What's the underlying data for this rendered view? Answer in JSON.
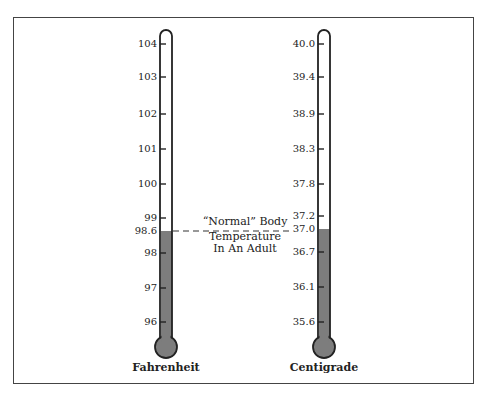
{
  "diagram": {
    "annotation": {
      "lines": [
        "“Normal” Body",
        "Temperature",
        "In An Adult"
      ]
    },
    "fahrenheit": {
      "title": "Fahrenheit",
      "ticks": [
        {
          "label": "104",
          "y": 44
        },
        {
          "label": "103",
          "y": 77
        },
        {
          "label": "102",
          "y": 114
        },
        {
          "label": "101",
          "y": 149
        },
        {
          "label": "100",
          "y": 184
        },
        {
          "label": "99",
          "y": 218
        },
        {
          "label": "98.6",
          "y": 231
        },
        {
          "label": "98",
          "y": 253
        },
        {
          "label": "97",
          "y": 288
        },
        {
          "label": "96",
          "y": 322
        }
      ],
      "fill_level": "98.6"
    },
    "centigrade": {
      "title": "Centigrade",
      "ticks": [
        {
          "label": "40.0",
          "y": 44
        },
        {
          "label": "39.4",
          "y": 77
        },
        {
          "label": "38.9",
          "y": 114
        },
        {
          "label": "38.3",
          "y": 149
        },
        {
          "label": "37.8",
          "y": 184
        },
        {
          "label": "37.2",
          "y": 216
        },
        {
          "label": "37.0",
          "y": 229
        },
        {
          "label": "36.7",
          "y": 252
        },
        {
          "label": "36.1",
          "y": 287
        },
        {
          "label": "35.6",
          "y": 322
        }
      ],
      "fill_level": "37.0"
    },
    "colors": {
      "fill": "#7d7d7d",
      "outline": "#222222",
      "frame": "#444444"
    }
  }
}
